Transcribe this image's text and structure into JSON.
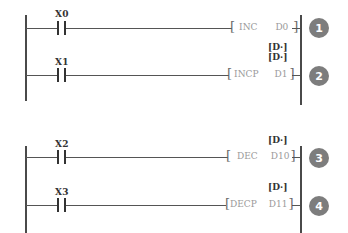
{
  "diagram": {
    "type": "ladder",
    "groups": [
      {
        "rungs": [
          {
            "contact": "X0",
            "instruction": "INC",
            "operand": "D0",
            "operand_label": "",
            "marker": "1"
          },
          {
            "contact": "X1",
            "instruction": "INCP",
            "operand": "D1",
            "operand_label": "[D·]",
            "marker": "2"
          }
        ],
        "between_label": "[D·]"
      },
      {
        "rungs": [
          {
            "contact": "X2",
            "instruction": "DEC",
            "operand": "D10",
            "operand_label": "[D·]",
            "marker": "3"
          },
          {
            "contact": "X3",
            "instruction": "DECP",
            "operand": "D11",
            "operand_label": "[D·]",
            "marker": "4"
          }
        ]
      }
    ],
    "colors": {
      "rail": "#4a4a4a",
      "marker_fill": "#7d7d7d",
      "instruction_text": "#9a9a9a",
      "label_text": "#333333"
    }
  }
}
